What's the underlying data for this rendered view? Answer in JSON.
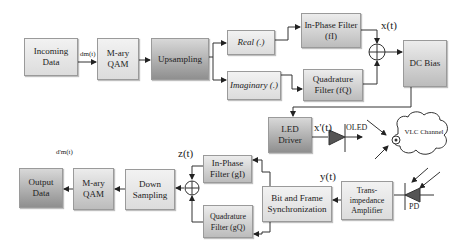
{
  "transmitter": {
    "incoming_data": "Incoming Data",
    "mary_qam": "M-ary QAM",
    "upsampling": "Upsampling",
    "real": "Real (.)",
    "imaginary": "Imaginary (.)",
    "inphase_filter": "In-Phase Filter (fI)",
    "quadrature_filter": "Quadrature Filter (fQ)",
    "dc_bias": "DC Bias",
    "led_driver": "LED Driver",
    "signal_dm": "dm(t)",
    "signal_x": "x(t)",
    "signal_xprime": "x'(t)",
    "oled": "OLED"
  },
  "channel": {
    "label": "VLC Channel"
  },
  "receiver": {
    "pd": "PD",
    "tia": "Trans-impedance Amplifier",
    "sync": "Bit and Frame Synchronization",
    "inphase_filter": "In-Phase Filter (gI)",
    "quadrature_filter": "Quadrature Filter (gQ)",
    "down_sampling": "Down Sampling",
    "mary_qam": "M-ary QAM",
    "output_data": "Output Data",
    "signal_y": "y(t)",
    "signal_z": "z(t)",
    "signal_dm_prime": "d'm(t)"
  }
}
